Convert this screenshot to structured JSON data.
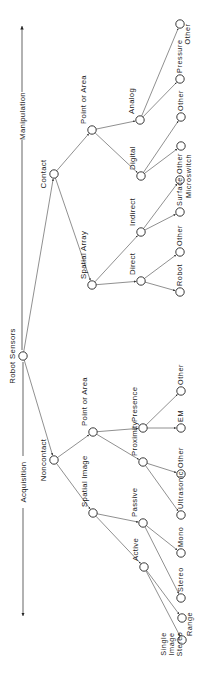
{
  "diagram": {
    "axis": {
      "top_label": "Manipulation",
      "bottom_label": "Acquisition"
    },
    "root": {
      "id": "robot-sensors",
      "label": "Robot Sensors",
      "x": 23,
      "y": 356
    },
    "nodes": [
      {
        "id": "contact",
        "label": "Contact",
        "parent": "robot-sensors",
        "x": 54,
        "y": 174
      },
      {
        "id": "noncontact",
        "label": "Noncontact",
        "parent": "robot-sensors",
        "x": 54,
        "y": 460
      },
      {
        "id": "c-point-area",
        "label": "Point or Area",
        "parent": "contact",
        "x": 92,
        "y": 130
      },
      {
        "id": "c-spatial-array",
        "label": "Spatial Array",
        "parent": "contact",
        "x": 92,
        "y": 285
      },
      {
        "id": "n-point-area",
        "label": "Point or Area",
        "parent": "noncontact",
        "x": 93,
        "y": 432
      },
      {
        "id": "n-spatial-image",
        "label": "Spatial Image",
        "parent": "noncontact",
        "x": 93,
        "y": 513
      },
      {
        "id": "analog",
        "label": "Analog",
        "parent": "c-point-area",
        "x": 140,
        "y": 120
      },
      {
        "id": "digital",
        "label": "Digital",
        "parent": "c-point-area",
        "x": 141,
        "y": 176
      },
      {
        "id": "indirect",
        "label": "Indirect",
        "parent": "c-spatial-array",
        "x": 141,
        "y": 232
      },
      {
        "id": "direct",
        "label": "Direct",
        "parent": "c-spatial-array",
        "x": 141,
        "y": 281
      },
      {
        "id": "presence",
        "label": "Presence",
        "parent": "n-point-area",
        "x": 143,
        "y": 428
      },
      {
        "id": "proximity",
        "label": "Proximity",
        "parent": "n-point-area",
        "x": 143,
        "y": 462
      },
      {
        "id": "passive",
        "label": "Passive",
        "parent": "n-spatial-image",
        "x": 143,
        "y": 523
      },
      {
        "id": "active",
        "label": "Active",
        "parent": "n-spatial-image",
        "x": 144,
        "y": 567
      },
      {
        "id": "analog-other",
        "label": "Other",
        "parent": "analog",
        "x": 180,
        "y": 24
      },
      {
        "id": "pressure",
        "label": "Pressure",
        "parent": "analog",
        "x": 180,
        "y": 79
      },
      {
        "id": "digital-other",
        "label": "Other",
        "parent": "digital",
        "x": 181,
        "y": 117
      },
      {
        "id": "microswitch",
        "label": "Microswitch",
        "parent": "digital",
        "x": 181,
        "y": 146
      },
      {
        "id": "indirect-other",
        "label": "Other",
        "parent": "indirect",
        "x": 180,
        "y": 180
      },
      {
        "id": "surface",
        "label": "Surface",
        "parent": "indirect",
        "x": 180,
        "y": 212
      },
      {
        "id": "direct-other",
        "label": "Other",
        "parent": "direct",
        "x": 180,
        "y": 252
      },
      {
        "id": "robot",
        "label": "Robot",
        "parent": "direct",
        "x": 180,
        "y": 292
      },
      {
        "id": "presence-other",
        "label": "Other",
        "parent": "presence",
        "x": 181,
        "y": 391
      },
      {
        "id": "em",
        "label": "EM",
        "parent": "presence",
        "x": 181,
        "y": 428
      },
      {
        "id": "proximity-other",
        "label": "Other",
        "parent": "proximity",
        "x": 181,
        "y": 474
      },
      {
        "id": "ultrasonic",
        "label": "Ultrasonic",
        "parent": "proximity",
        "x": 181,
        "y": 515
      },
      {
        "id": "mono",
        "label": "Mono",
        "parent": "passive",
        "x": 181,
        "y": 553
      },
      {
        "id": "stereo",
        "label": "Stereo",
        "parent": "passive",
        "x": 181,
        "y": 598
      },
      {
        "id": "range",
        "label": "Range",
        "parent": "active",
        "x": 182,
        "y": 618
      },
      {
        "id": "single-image-stereo",
        "label": "Single Image Stereo",
        "label_lines": [
          "Single",
          "Image",
          "Stereo"
        ],
        "parent": "active",
        "x": 182,
        "y": 640
      }
    ]
  }
}
